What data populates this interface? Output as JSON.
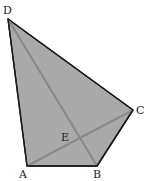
{
  "diagram": {
    "type": "quadrilateral-with-diagonals",
    "fill_color": "#a9a9a9",
    "edge_color": "#1a1a1a",
    "diagonal_color": "#8a8a8a",
    "vertices": [
      {
        "name": "A",
        "x": 27,
        "y": 166,
        "label_x": 19,
        "label_y": 178
      },
      {
        "name": "B",
        "x": 97,
        "y": 166,
        "label_x": 93,
        "label_y": 178
      },
      {
        "name": "C",
        "x": 133,
        "y": 110,
        "label_x": 136,
        "label_y": 114
      },
      {
        "name": "D",
        "x": 8,
        "y": 19,
        "label_x": 3,
        "label_y": 14
      }
    ],
    "intersection": {
      "name": "E",
      "label_x": 61,
      "label_y": 141
    },
    "edges": [
      "AB",
      "BC",
      "CD",
      "DA"
    ],
    "diagonals": [
      "AC",
      "BD"
    ]
  }
}
